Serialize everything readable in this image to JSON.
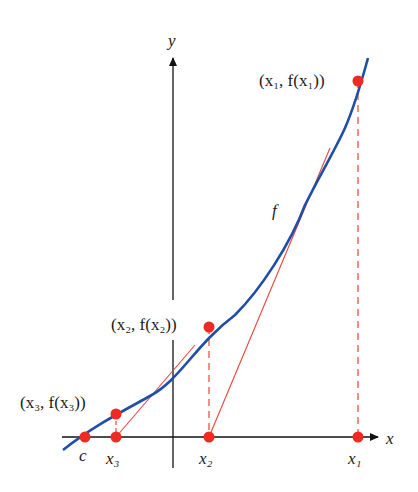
{
  "diagram": {
    "axes": {
      "x_label": "x",
      "y_label": "y"
    },
    "curve_label": "f",
    "points": [
      {
        "id": "p1",
        "label": "(x₁, f(x₁))",
        "axis_label": "x₁"
      },
      {
        "id": "p2",
        "label": "(x₂, f(x₂))",
        "axis_label": "x₂"
      },
      {
        "id": "p3",
        "label": "(x₃, f(x₃))",
        "axis_label": "x₃"
      }
    ],
    "root_label": "c",
    "colors": {
      "curve": "#1f4ea8",
      "secant": "#e8443a",
      "point": "#ee2a22",
      "axis": "#111111"
    }
  }
}
